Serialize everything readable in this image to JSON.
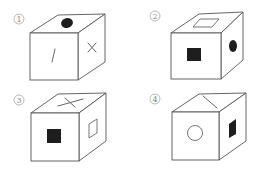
{
  "figure": {
    "title": "",
    "options": [
      {
        "label": "1",
        "faces": {
          "top": "filled-circle",
          "front": "slash-line",
          "right": "cross-x"
        }
      },
      {
        "label": "2",
        "faces": {
          "top": "hollow-square",
          "front": "filled-square",
          "right": "filled-circle"
        }
      },
      {
        "label": "3",
        "faces": {
          "top": "cross-x",
          "front": "filled-square",
          "right": "hollow-square"
        }
      },
      {
        "label": "4",
        "faces": {
          "top": "diagonal-line",
          "front": "hollow-circle",
          "right": "filled-square"
        }
      }
    ]
  },
  "colors": {
    "line": "#555555",
    "fill": "#1e1e1e",
    "background": "#ffffff"
  }
}
